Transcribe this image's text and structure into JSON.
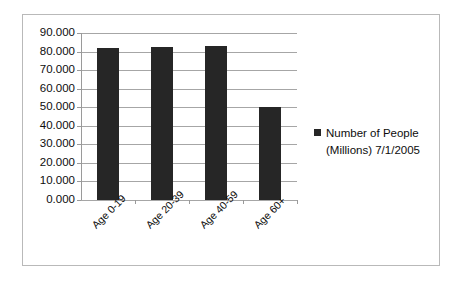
{
  "chart_data": {
    "type": "bar",
    "title": "",
    "xlabel": "",
    "ylabel": "",
    "categories": [
      "Age 0-19",
      "Age 20-39",
      "Age 40-59",
      "Age 60+"
    ],
    "series": [
      {
        "name": "Number of People (Millions) 7/1/2005",
        "values": [
          82.0,
          82.5,
          83.0,
          50.0
        ]
      }
    ],
    "ylim": [
      0,
      90
    ],
    "ytick_step": 10,
    "ytick_labels": [
      "90.000",
      "80.000",
      "70.000",
      "60.000",
      "50.000",
      "40.000",
      "30.000",
      "20.000",
      "10.000",
      "0.000"
    ],
    "ytick_values": [
      90,
      80,
      70,
      60,
      50,
      40,
      30,
      20,
      10,
      0
    ],
    "grid": true,
    "grid_axis": "y",
    "legend_position": "right",
    "bar_color": "#262626",
    "gridline_color": "#a6a6a6",
    "frame_color": "#b9b9b9",
    "background_color": "#ffffff",
    "xtick_label_rotation": -45
  },
  "legend": {
    "entries": [
      {
        "label": "Number of People\n(Millions) 7/1/2005",
        "marker": "square-marker",
        "color": "#262626"
      }
    ]
  }
}
